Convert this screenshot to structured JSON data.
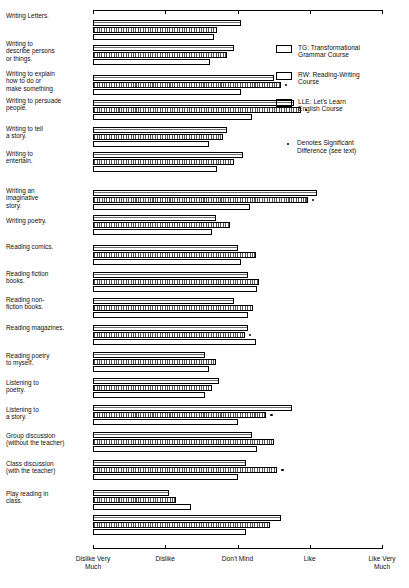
{
  "chart_data": {
    "type": "bar",
    "orientation": "horizontal",
    "title": "",
    "xlabel": "",
    "ylabel": "",
    "xlim": [
      1,
      5
    ],
    "grid": false,
    "tick_labels": [
      "Dislike Very\nMuch",
      "Dislike",
      "Don't Mind",
      "Like",
      "Like Very\nMuch"
    ],
    "tick_values": [
      1,
      2,
      3,
      4,
      5
    ],
    "legend_position": "upper-right",
    "series": [
      {
        "name": "TG",
        "label": "TG: Transformational\nGrammar Course",
        "pattern": "horizontal-lines"
      },
      {
        "name": "RW",
        "label": "RW: Reading-Writing\nCourse",
        "pattern": "dotted"
      },
      {
        "name": "LLE",
        "label": "LLE: Let's Learn\nEnglish Course",
        "pattern": "plain"
      }
    ],
    "significance_note": "Denotes Significant\nDifference (see text)",
    "categories": [
      "Writing Letters.",
      "Writing to\ndescribe persons\nor things.",
      "Writing to explain\nhow to do or\nmake something.",
      "Writing to persuade\npeople.",
      "Writing to tell\na story.",
      "Writing to\nentertain.",
      "Writing an\nimaginative\nstory.",
      "Writing poetry.",
      "Reading comics.",
      "Reading fiction\nbooks.",
      "Reading non-\nfiction books.",
      "Reading magazines.",
      "Reading poetry\nto myself.",
      "Listening to\npoetry.",
      "Listening to\na story.",
      "Group discussion\n(without the teacher)",
      "Class discussion\n(with the teacher)",
      "Play reading in\nclass."
    ],
    "values": {
      "TG": [
        3.05,
        2.95,
        3.5,
        3.78,
        2.85,
        3.08,
        4.1,
        2.7,
        3.0,
        3.15,
        2.95,
        3.15,
        2.55,
        2.75,
        3.75,
        3.2,
        3.12,
        2.05,
        3.6
      ],
      "RW": [
        2.72,
        2.85,
        3.6,
        3.88,
        2.8,
        2.95,
        3.97,
        2.9,
        3.25,
        3.3,
        3.22,
        3.1,
        2.7,
        2.65,
        3.4,
        3.5,
        3.55,
        2.15,
        3.45
      ],
      "LLE": [
        2.68,
        2.62,
        3.05,
        3.2,
        2.6,
        2.72,
        3.17,
        2.65,
        3.05,
        3.27,
        3.15,
        3.25,
        2.6,
        2.55,
        3.0,
        3.27,
        3.0,
        2.35,
        3.12
      ]
    },
    "significant": [
      2,
      3,
      6,
      11,
      14,
      16
    ],
    "series_values": [
      {
        "category": "Writing Letters.",
        "TG": 3.05,
        "RW": 2.72,
        "LLE": 2.68,
        "significant": false
      },
      {
        "category": "Writing to describe persons or things.",
        "TG": 2.95,
        "RW": 2.85,
        "LLE": 2.62,
        "significant": false
      },
      {
        "category": "Writing to explain how to do or make something.",
        "TG": 3.5,
        "RW": 3.6,
        "LLE": 3.05,
        "significant": true
      },
      {
        "category": "Writing to persuade people.",
        "TG": 3.78,
        "RW": 3.88,
        "LLE": 3.2,
        "significant": true
      },
      {
        "category": "Writing to tell a story.",
        "TG": 2.85,
        "RW": 2.8,
        "LLE": 2.6,
        "significant": false
      },
      {
        "category": "Writing to entertain.",
        "TG": 3.08,
        "RW": 2.95,
        "LLE": 2.72,
        "significant": false
      },
      {
        "category": "Writing an imaginative story.",
        "TG": 4.1,
        "RW": 3.97,
        "LLE": 3.17,
        "significant": true
      },
      {
        "category": "Writing poetry.",
        "TG": 2.7,
        "RW": 2.9,
        "LLE": 2.65,
        "significant": false
      },
      {
        "category": "Reading comics.",
        "TG": 3.0,
        "RW": 3.25,
        "LLE": 3.05,
        "significant": false
      },
      {
        "category": "Reading fiction books.",
        "TG": 3.15,
        "RW": 3.3,
        "LLE": 3.27,
        "significant": false
      },
      {
        "category": "Reading non-fiction books.",
        "TG": 2.95,
        "RW": 3.22,
        "LLE": 3.15,
        "significant": false
      },
      {
        "category": "Reading magazines.",
        "TG": 3.15,
        "RW": 3.1,
        "LLE": 3.25,
        "significant": true
      },
      {
        "category": "Reading poetry to myself.",
        "TG": 2.55,
        "RW": 2.7,
        "LLE": 2.6,
        "significant": false
      },
      {
        "category": "Listening to poetry.",
        "TG": 2.75,
        "RW": 2.65,
        "LLE": 2.55,
        "significant": false
      },
      {
        "category": "Listening to a story.",
        "TG": 3.75,
        "RW": 3.4,
        "LLE": 3.0,
        "significant": true
      },
      {
        "category": "Group discussion (without the teacher)",
        "TG": 3.2,
        "RW": 3.5,
        "LLE": 3.27,
        "significant": false
      },
      {
        "category": "Class discussion (with the teacher)",
        "TG": 3.12,
        "RW": 3.55,
        "LLE": 3.0,
        "significant": true
      },
      {
        "category": "Studying sentences.",
        "TG": 2.05,
        "RW": 2.15,
        "LLE": 2.35,
        "significant": false
      },
      {
        "category": "Play reading in class.",
        "TG": 3.6,
        "RW": 3.45,
        "LLE": 3.12,
        "significant": false
      }
    ]
  },
  "legend": {
    "tg": "TG: Transformational\nGrammar Course",
    "rw": "RW: Reading-Writing\nCourse",
    "lle": "LLE: Let's Learn\nEnglish Course",
    "note": "Denotes Significant\nDifference (see text)"
  },
  "axis": {
    "t1": "Dislike Very\nMuch",
    "t2": "Dislike",
    "t3": "Don't Mind",
    "t4": "Like",
    "t5": "Like Very\nMuch"
  }
}
